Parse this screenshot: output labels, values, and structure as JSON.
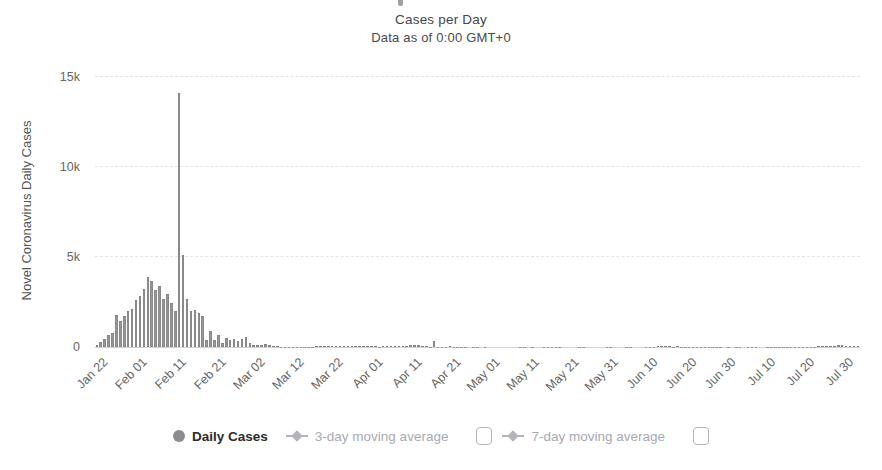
{
  "header": {
    "title": "Cases per Day",
    "subtitle": "Data as of 0:00 GMT+0"
  },
  "y_axis": {
    "title": "Novel Coronavirus Daily Cases",
    "ticks": [
      "0",
      "5k",
      "10k",
      "15k"
    ]
  },
  "x_axis": {
    "ticks": [
      "Jan 22",
      "Feb 01",
      "Feb 11",
      "Feb 21",
      "Mar 02",
      "Mar 12",
      "Mar 22",
      "Apr 01",
      "Apr 11",
      "Apr 21",
      "May 01",
      "May 11",
      "May 21",
      "May 31",
      "Jun 10",
      "Jun 20",
      "Jun 30",
      "Jul 10",
      "Jul 20",
      "Jul 30"
    ]
  },
  "legend": {
    "items": [
      {
        "label": "Daily Cases",
        "marker": "circle",
        "active": true
      },
      {
        "label": "3-day moving average",
        "marker": "diamond-line",
        "active": false,
        "checkbox": "unchecked"
      },
      {
        "label": "7-day moving average",
        "marker": "diamond-line",
        "active": false,
        "checkbox": "unchecked"
      }
    ]
  },
  "colors": {
    "bar_fill": "#979797",
    "bar_edge": "#7d7d7d",
    "gridline": "#e4e4e4",
    "axis_line": "#d2d2d2",
    "tick_text": "#666666",
    "title_text": "#454545",
    "legend_active_text": "#2b2b2b",
    "legend_inactive": "#a9a9b2"
  },
  "chart_data": {
    "type": "bar",
    "title": "Cases per Day",
    "subtitle": "Data as of 0:00 GMT+0",
    "xlabel": "",
    "ylabel": "Novel Coronavirus Daily Cases",
    "ylim": [
      0,
      15000
    ],
    "y_tick_values": [
      0,
      5000,
      10000,
      15000
    ],
    "grid": "horizontal-dashed",
    "legend_position": "bottom",
    "series_name": "Daily Cases",
    "start_date": "Jan 22",
    "end_date": "Aug 03",
    "interval": "daily",
    "x_tick_labels": [
      "Jan 22",
      "Feb 01",
      "Feb 11",
      "Feb 21",
      "Mar 02",
      "Mar 12",
      "Mar 22",
      "Apr 01",
      "Apr 11",
      "Apr 21",
      "May 01",
      "May 11",
      "May 21",
      "May 31",
      "Jun 10",
      "Jun 20",
      "Jun 30",
      "Jul 10",
      "Jul 20",
      "Jul 30"
    ],
    "peak": {
      "date": "Feb 12",
      "value": 14108
    },
    "values": [
      106,
      259,
      457,
      688,
      769,
      1771,
      1459,
      1737,
      1981,
      2099,
      2589,
      2825,
      3235,
      3887,
      3694,
      3143,
      3385,
      2652,
      2973,
      2467,
      2015,
      14108,
      5090,
      2641,
      2009,
      2048,
      1886,
      1749,
      391,
      889,
      397,
      648,
      214,
      508,
      406,
      433,
      327,
      427,
      573,
      202,
      125,
      119,
      139,
      143,
      99,
      44,
      40,
      19,
      24,
      15,
      8,
      11,
      20,
      16,
      21,
      13,
      34,
      39,
      41,
      46,
      39,
      78,
      47,
      67,
      55,
      54,
      45,
      31,
      48,
      36,
      35,
      31,
      19,
      30,
      39,
      32,
      62,
      63,
      42,
      46,
      99,
      108,
      89,
      46,
      46,
      26,
      352,
      27,
      16,
      11,
      30,
      10,
      6,
      12,
      11,
      3,
      6,
      22,
      4,
      12,
      1,
      2,
      3,
      1,
      2,
      2,
      1,
      1,
      14,
      17,
      1,
      7,
      3,
      4,
      8,
      5,
      7,
      6,
      5,
      2,
      4,
      2,
      3,
      11,
      7,
      1,
      2,
      0,
      4,
      2,
      16,
      5,
      1,
      1,
      1,
      5,
      6,
      4,
      4,
      3,
      11,
      7,
      11,
      57,
      49,
      40,
      44,
      28,
      32,
      27,
      26,
      18,
      22,
      12,
      19,
      21,
      17,
      21,
      12,
      19,
      3,
      5,
      3,
      8,
      14,
      4,
      8,
      8,
      9,
      4,
      2,
      7,
      8,
      10,
      6,
      11,
      10,
      22,
      16,
      22,
      11,
      14,
      19,
      28,
      34,
      46,
      61,
      57,
      68,
      105,
      127,
      45,
      49,
      33,
      36
    ]
  }
}
